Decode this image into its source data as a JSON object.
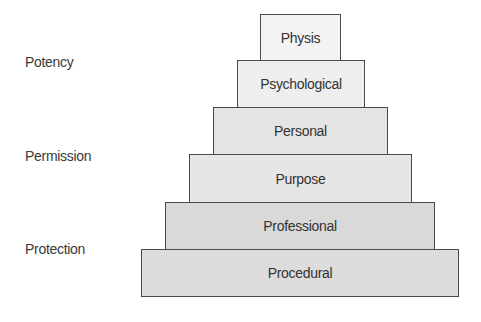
{
  "diagram": {
    "type": "stacked-pyramid",
    "side_labels": [
      {
        "text": "Potency",
        "y": 62
      },
      {
        "text": "Permission",
        "y": 156
      },
      {
        "text": "Protection",
        "y": 249
      }
    ],
    "tiers": [
      {
        "label": "Physis",
        "left": 260,
        "top": 14,
        "width": 81,
        "height": 47,
        "fill": "#f3f3f3"
      },
      {
        "label": "Psychological",
        "left": 237,
        "top": 60,
        "width": 128,
        "height": 48,
        "fill": "#eeeeee"
      },
      {
        "label": "Personal",
        "left": 213,
        "top": 107,
        "width": 175,
        "height": 48,
        "fill": "#e4e4e4"
      },
      {
        "label": "Purpose",
        "left": 189,
        "top": 154,
        "width": 223,
        "height": 49,
        "fill": "#e6e6e6"
      },
      {
        "label": "Professional",
        "left": 165,
        "top": 202,
        "width": 270,
        "height": 48,
        "fill": "#d9d9d9"
      },
      {
        "label": "Procedural",
        "left": 141,
        "top": 249,
        "width": 318,
        "height": 48,
        "fill": "#dcdcdc"
      }
    ]
  }
}
